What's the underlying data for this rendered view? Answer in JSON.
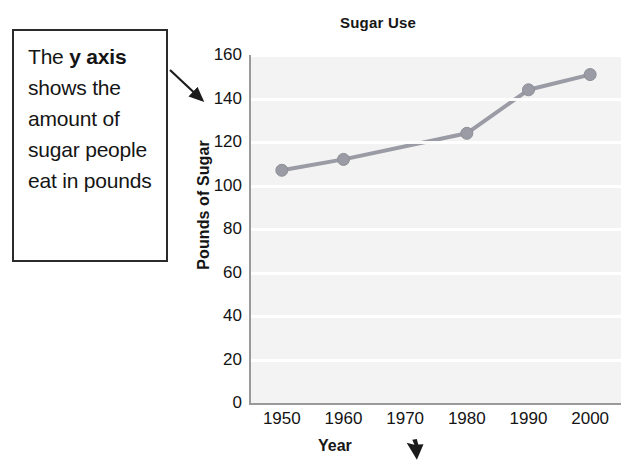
{
  "callout": {
    "text_before": "The ",
    "text_bold": "y axis",
    "text_after": " shows the amount of sugar people eat in pounds",
    "arrow_name": "callout-arrow"
  },
  "chart_data": {
    "type": "line",
    "title": "Sugar Use",
    "xlabel": "Year",
    "ylabel": "Pounds of Sugar",
    "categories": [
      "1950",
      "1960",
      "1970",
      "1980",
      "1990",
      "2000"
    ],
    "values": [
      107,
      112,
      null,
      124,
      144,
      151
    ],
    "points": [
      {
        "x": "1950",
        "y": 107
      },
      {
        "x": "1960",
        "y": 112
      },
      {
        "x": "1980",
        "y": 124
      },
      {
        "x": "1990",
        "y": 144
      },
      {
        "x": "2000",
        "y": 151
      }
    ],
    "ylim": [
      0,
      160
    ],
    "ytick_labels": [
      "160",
      "140",
      "120",
      "100",
      "80",
      "60",
      "40",
      "20",
      "0"
    ],
    "ytick_values": [
      160,
      140,
      120,
      100,
      80,
      60,
      40,
      20,
      0
    ],
    "xtick_labels": [
      "1950",
      "1960",
      "1970",
      "1980",
      "1990",
      "2000"
    ],
    "grid": true,
    "legend": null,
    "series_color": "#9a9ba4",
    "plot_background": "#f3f3f3",
    "axis_color": "#9a9a9a"
  },
  "annotations": {
    "year_cursor": "cursor-arrow-icon"
  }
}
